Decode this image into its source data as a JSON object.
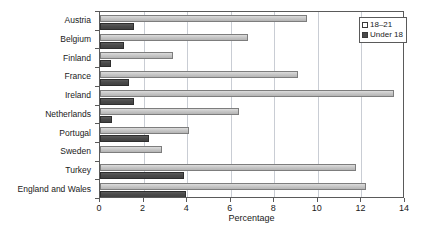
{
  "chart_data": {
    "type": "bar",
    "orientation": "horizontal",
    "title": "",
    "xlabel": "Percentage",
    "ylabel": "",
    "xlim": [
      0,
      14
    ],
    "xticks": [
      0,
      2,
      4,
      6,
      8,
      10,
      12,
      14
    ],
    "grid": "vertical",
    "legend_position": "top-right",
    "categories": [
      "Austria",
      "Belgium",
      "Finland",
      "France",
      "Ireland",
      "Netherlands",
      "Portugal",
      "Sweden",
      "Turkey",
      "England and Wales"
    ],
    "series": [
      {
        "name": "18–21",
        "color": "#c8c8c8",
        "values": [
          9.5,
          6.8,
          3.35,
          9.1,
          13.5,
          6.4,
          4.1,
          2.85,
          11.75,
          12.2
        ]
      },
      {
        "name": "Under 18",
        "color": "#4a4a4a",
        "values": [
          1.55,
          1.1,
          0.5,
          1.35,
          1.55,
          0.55,
          2.25,
          0.0,
          3.85,
          3.95
        ]
      }
    ]
  },
  "legend": {
    "items": [
      {
        "label": "18–21",
        "swatch": "light"
      },
      {
        "label": "Under 18",
        "swatch": "dark"
      }
    ]
  },
  "axis": {
    "x_title": "Percentage"
  }
}
